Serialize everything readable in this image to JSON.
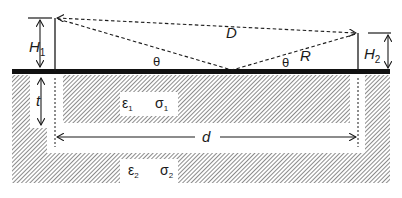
{
  "diagram": {
    "labels": {
      "H1": "H",
      "H1_sub": "1",
      "H2": "H",
      "H2_sub": "2",
      "D": "D",
      "R": "R",
      "theta_left": "θ",
      "theta_right": "θ",
      "t": "t",
      "d": "d",
      "eps1": "ε",
      "eps1_sub": "1",
      "sigma1": "σ",
      "sigma1_sub": "1",
      "eps2": "ε",
      "eps2_sub": "2",
      "sigma2": "σ",
      "sigma2_sub": "2"
    },
    "colors": {
      "ink": "#1a1a1a",
      "hatch": "#555555",
      "background": "#ffffff"
    }
  }
}
